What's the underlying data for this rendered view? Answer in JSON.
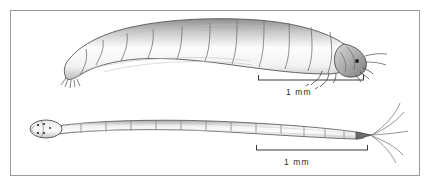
{
  "plate": {
    "name": "larvae-illustration-plate",
    "background_color": "#ffffff",
    "frame_color": "#9a9a9a",
    "ink_color": "#4a4a4a",
    "shading_color": "#b8b8b8"
  },
  "specimens": [
    {
      "id": "upper-larva",
      "name": "upper-larva-drawing",
      "description": "Curved, stout segmented beetle larva shown in lateral view, head to the right",
      "orientation": "head-right",
      "segment_count": 12,
      "features": [
        "head-capsule",
        "eye-spot",
        "mandibles",
        "antenna",
        "thoracic-legs",
        "caudal-setae"
      ]
    },
    {
      "id": "lower-larva",
      "name": "lower-larva-drawing",
      "description": "Slender elongate segmented larva shown in dorsal view, head to the left with long caudal setae",
      "orientation": "head-left",
      "segment_count": 13,
      "features": [
        "oval-head-capsule",
        "eye-spots",
        "caudal-setae"
      ]
    }
  ],
  "scale_bars": [
    {
      "id": "upper-scale-bar",
      "name": "scale-bar-upper",
      "label": "1 mm",
      "for_specimen": "upper-larva",
      "x_start": 258,
      "x_end": 364,
      "y": 80
    },
    {
      "id": "lower-scale-bar",
      "name": "scale-bar-lower",
      "label": "1 mm",
      "for_specimen": "lower-larva",
      "x_start": 256,
      "x_end": 368,
      "y": 150
    }
  ]
}
